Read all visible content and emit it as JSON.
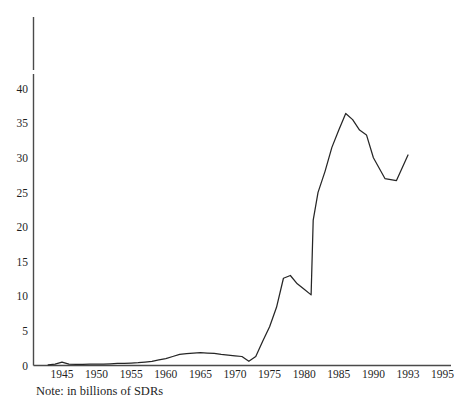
{
  "chart_data": {
    "type": "line",
    "title": "",
    "subtitle": "",
    "xlabel": "",
    "ylabel": "",
    "note": "Note: in billions of SDRs",
    "units": "billions of SDRs",
    "grid": false,
    "legend": false,
    "legend_position": "none",
    "line_color": "#262626",
    "axis_color": "#4a4a4a",
    "background_color": "#ffffff",
    "ylim": [
      0,
      42
    ],
    "yticks": [
      0,
      5,
      10,
      15,
      20,
      25,
      30,
      35,
      40
    ],
    "ytick_labels": [
      "0",
      "5",
      "10",
      "15",
      "20",
      "25",
      "30",
      "35",
      "40"
    ],
    "xtick_labels": [
      "1945",
      "1950",
      "1955",
      "1960",
      "1965",
      "1970",
      "1975",
      "1980",
      "1985",
      "1990",
      "1993",
      "1995"
    ],
    "xtick_positions": [
      1945,
      1950,
      1955,
      1960,
      1965,
      1970,
      1975,
      1980,
      1985,
      1990,
      1993,
      1995
    ],
    "x_axis_note": "tick labels drawn at equal pixel spacing although 1990-1993-1995 spans unequal year intervals",
    "xlim": [
      1942,
      1995
    ],
    "series": [
      {
        "name": "IMF credit outstanding",
        "x": [
          1943,
          1944,
          1945,
          1946,
          1947,
          1948,
          1949,
          1950,
          1951,
          1952,
          1953,
          1954,
          1955,
          1956,
          1957,
          1958,
          1959,
          1960,
          1961,
          1962,
          1963,
          1964,
          1965,
          1966,
          1967,
          1968,
          1969,
          1970,
          1971,
          1972,
          1973,
          1974,
          1975,
          1976,
          1977,
          1978,
          1979,
          1980,
          1981,
          1981.3,
          1982,
          1983,
          1984,
          1985,
          1986,
          1987,
          1988,
          1989,
          1990,
          1991,
          1992,
          1993
        ],
        "values": [
          0.1,
          0.2,
          0.5,
          0.2,
          0.15,
          0.15,
          0.2,
          0.2,
          0.2,
          0.25,
          0.3,
          0.3,
          0.35,
          0.4,
          0.5,
          0.6,
          0.8,
          1.0,
          1.3,
          1.6,
          1.7,
          1.8,
          1.85,
          1.8,
          1.75,
          1.6,
          1.5,
          1.4,
          1.3,
          0.6,
          1.3,
          3.5,
          5.6,
          8.4,
          12.6,
          13.0,
          11.8,
          11.0,
          10.2,
          21.0,
          25.0,
          28.0,
          31.5,
          34.0,
          36.4,
          35.5,
          34.0,
          33.3,
          30.0,
          27.0,
          26.7,
          30.4
        ]
      }
    ]
  },
  "axes": {
    "y_axis_name": "value-axis",
    "x_axis_name": "year-axis"
  }
}
